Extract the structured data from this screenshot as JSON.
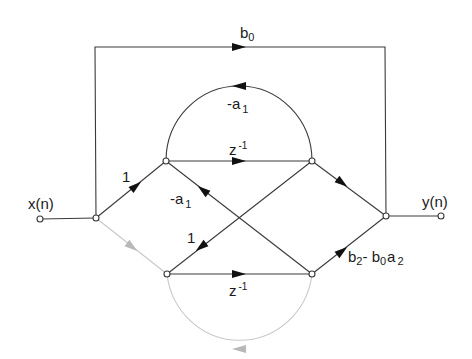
{
  "diagram": {
    "type": "signal-flow-graph",
    "input_label": "x(n)",
    "output_label": "y(n)",
    "nodes": [
      {
        "id": "input",
        "x": 40,
        "y": 219
      },
      {
        "id": "split",
        "x": 96,
        "y": 218
      },
      {
        "id": "upper-left",
        "x": 166,
        "y": 161
      },
      {
        "id": "upper-right",
        "x": 312,
        "y": 161
      },
      {
        "id": "lower-left",
        "x": 167,
        "y": 274
      },
      {
        "id": "lower-right",
        "x": 312,
        "y": 274
      },
      {
        "id": "sum",
        "x": 386,
        "y": 216
      },
      {
        "id": "output",
        "x": 441,
        "y": 216
      }
    ],
    "edges": [
      {
        "from": "input",
        "to": "split",
        "gain": ""
      },
      {
        "from": "split",
        "to": "sum",
        "gain": "b0",
        "route": "top-bypass"
      },
      {
        "from": "split",
        "to": "upper-left",
        "gain": "1"
      },
      {
        "from": "split",
        "to": "lower-left",
        "gain": "",
        "faint": true
      },
      {
        "from": "upper-left",
        "to": "upper-right",
        "gain": "z^-1"
      },
      {
        "from": "upper-right",
        "to": "upper-left",
        "gain": "-a1",
        "route": "upper-arc"
      },
      {
        "from": "lower-right",
        "to": "upper-left",
        "gain": "-a1"
      },
      {
        "from": "upper-right",
        "to": "lower-left",
        "gain": "1"
      },
      {
        "from": "upper-right",
        "to": "sum",
        "gain": ""
      },
      {
        "from": "lower-left",
        "to": "lower-right",
        "gain": "z^-1"
      },
      {
        "from": "lower-right",
        "to": "lower-left",
        "gain": "",
        "route": "lower-arc",
        "faint": true
      },
      {
        "from": "lower-right",
        "to": "sum",
        "gain": "b2- b0a2"
      },
      {
        "from": "sum",
        "to": "output",
        "gain": ""
      }
    ]
  },
  "labels": {
    "b0": {
      "base": "b",
      "sub": "0"
    },
    "gain_one_top": "1",
    "gain_one_mid": "1",
    "upper_arc": {
      "prefix": "-a",
      "sub": "1"
    },
    "cross": {
      "prefix": "-a",
      "sub": "1"
    },
    "upper_delay": {
      "base": "z",
      "sup": "-1"
    },
    "lower_delay": {
      "base": "z",
      "sup": "-1"
    },
    "lower_right_gain": {
      "b2": "b",
      "b2_sub": "2",
      "sep": "- ",
      "b0": "b",
      "b0_sub": "0",
      "a2": "a",
      "a2_sub": "2"
    },
    "input": "x(n)",
    "output": "y(n)"
  }
}
